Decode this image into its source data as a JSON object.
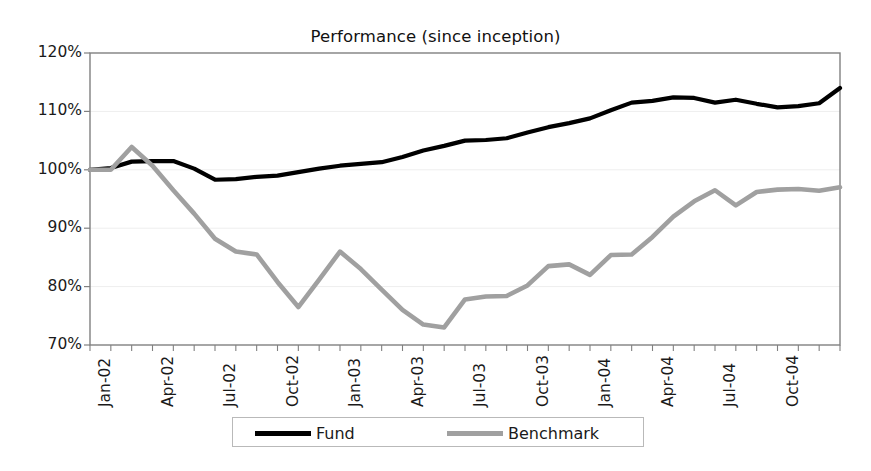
{
  "chart_data": {
    "type": "line",
    "title": "Performance (since inception)",
    "xlabel": "",
    "ylabel": "",
    "ylim": [
      70,
      120
    ],
    "ytick_labels": [
      "120%",
      "110%",
      "100%",
      "90%",
      "80%",
      "70%"
    ],
    "ytick_values": [
      120,
      110,
      100,
      90,
      80,
      70
    ],
    "grid": "horizontal-light",
    "legend_position": "bottom-center",
    "x": [
      "Jan-02",
      "Feb-02",
      "Mar-02",
      "Apr-02",
      "May-02",
      "Jun-02",
      "Jul-02",
      "Aug-02",
      "Sep-02",
      "Oct-02",
      "Nov-02",
      "Dec-02",
      "Jan-03",
      "Feb-03",
      "Mar-03",
      "Apr-03",
      "May-03",
      "Jun-03",
      "Jul-03",
      "Aug-03",
      "Sep-03",
      "Oct-03",
      "Nov-03",
      "Dec-03",
      "Jan-04",
      "Feb-04",
      "Mar-04",
      "Apr-04",
      "May-04",
      "Jun-04",
      "Jul-04",
      "Aug-04",
      "Sep-04",
      "Oct-04",
      "Nov-04",
      "Dec-04"
    ],
    "xtick_labels": [
      "Jan-02",
      "Apr-02",
      "Jul-02",
      "Oct-02",
      "Jan-03",
      "Apr-03",
      "Jul-03",
      "Oct-03",
      "Jan-04",
      "Apr-04",
      "Jul-04",
      "Oct-04"
    ],
    "xtick_indices": [
      0,
      3,
      6,
      9,
      12,
      15,
      18,
      21,
      24,
      27,
      30,
      33
    ],
    "series": [
      {
        "name": "Fund",
        "color": "#000000",
        "width": 4.2,
        "values": [
          100.0,
          100.3,
          101.4,
          101.5,
          101.5,
          100.2,
          98.3,
          98.4,
          98.8,
          99.0,
          99.6,
          100.2,
          100.7,
          101.0,
          101.3,
          102.2,
          103.3,
          104.1,
          105.0,
          105.1,
          105.4,
          106.4,
          107.3,
          108.0,
          108.8,
          110.2,
          111.5,
          111.8,
          112.4,
          112.3,
          111.5,
          112.0,
          111.3,
          110.7,
          110.9,
          111.4
        ]
      },
      {
        "name": "Benchmark",
        "color": "#a0a0a0",
        "width": 4.6,
        "values": [
          100.0,
          100.0,
          103.9,
          100.7,
          96.5,
          92.5,
          88.2,
          86.0,
          85.5,
          80.8,
          76.5,
          81.2,
          86.0,
          83.0,
          79.5,
          76.0,
          73.5,
          73.0,
          77.8,
          78.3,
          78.4,
          80.2,
          83.5,
          83.8,
          82.0,
          85.4,
          85.5,
          88.5,
          92.0,
          94.6,
          96.5,
          93.9,
          96.2,
          96.6,
          96.7,
          96.4
        ]
      }
    ],
    "series_tail": {
      "fund_final": 114.0,
      "benchmark_final": 97.0
    },
    "axis_color": "#808080",
    "text_color": "#1a1a1a"
  },
  "legend": {
    "items": [
      {
        "label": "Fund",
        "color": "#000000"
      },
      {
        "label": "Benchmark",
        "color": "#a0a0a0"
      }
    ]
  }
}
